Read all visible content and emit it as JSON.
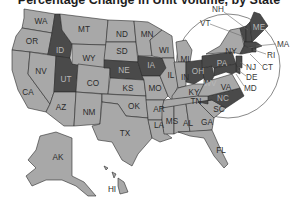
{
  "title": "Percentage Change in Unit Volume, by State",
  "colors": {
    "light": "#a8a8a8",
    "dark": "#4a4a4a",
    "border": "#2a2a2a",
    "background": "#ffffff"
  },
  "states": {
    "WA": {
      "label": "WA",
      "shade": "light"
    },
    "OR": {
      "label": "OR",
      "shade": "light"
    },
    "CA": {
      "label": "CA",
      "shade": "light"
    },
    "ID": {
      "label": "ID",
      "shade": "dark"
    },
    "NV": {
      "label": "NV",
      "shade": "light"
    },
    "UT": {
      "label": "UT",
      "shade": "dark"
    },
    "AZ": {
      "label": "AZ",
      "shade": "light"
    },
    "MT": {
      "label": "MT",
      "shade": "light"
    },
    "WY": {
      "label": "WY",
      "shade": "light"
    },
    "CO": {
      "label": "CO",
      "shade": "light"
    },
    "NM": {
      "label": "NM",
      "shade": "light"
    },
    "ND": {
      "label": "ND",
      "shade": "light"
    },
    "SD": {
      "label": "SD",
      "shade": "light"
    },
    "NE": {
      "label": "NE",
      "shade": "dark"
    },
    "KS": {
      "label": "KS",
      "shade": "light"
    },
    "OK": {
      "label": "OK",
      "shade": "light"
    },
    "TX": {
      "label": "TX",
      "shade": "light"
    },
    "MN": {
      "label": "MN",
      "shade": "light"
    },
    "IA": {
      "label": "IA",
      "shade": "dark"
    },
    "MO": {
      "label": "MO",
      "shade": "light"
    },
    "AR": {
      "label": "AR",
      "shade": "light"
    },
    "LA": {
      "label": "LA",
      "shade": "light"
    },
    "WI": {
      "label": "WI",
      "shade": "light"
    },
    "IL": {
      "label": "IL",
      "shade": "light"
    },
    "MI": {
      "label": "MI",
      "shade": "light"
    },
    "IN": {
      "label": "IN",
      "shade": "light"
    },
    "OH": {
      "label": "OH",
      "shade": "dark"
    },
    "KY": {
      "label": "KY",
      "shade": "light"
    },
    "TN": {
      "label": "TN",
      "shade": "light"
    },
    "MS": {
      "label": "MS",
      "shade": "light"
    },
    "AL": {
      "label": "AL",
      "shade": "light"
    },
    "GA": {
      "label": "GA",
      "shade": "light"
    },
    "FL": {
      "label": "FL",
      "shade": "light"
    },
    "SC": {
      "label": "SC",
      "shade": "light"
    },
    "NC": {
      "label": "NC",
      "shade": "dark"
    },
    "VA": {
      "label": "VA",
      "shade": "light"
    },
    "WV": {
      "label": "WV",
      "shade": "dark"
    },
    "PA": {
      "label": "PA",
      "shade": "dark"
    },
    "NY": {
      "label": "NY",
      "shade": "light"
    },
    "VT": {
      "label": "VT",
      "shade": "dark"
    },
    "NH": {
      "label": "NH",
      "shade": "dark"
    },
    "ME": {
      "label": "ME",
      "shade": "dark"
    },
    "MA": {
      "label": "MA",
      "shade": "dark"
    },
    "RI": {
      "label": "RI",
      "shade": "dark"
    },
    "CT": {
      "label": "CT",
      "shade": "dark"
    },
    "NJ": {
      "label": "NJ",
      "shade": "dark"
    },
    "DE": {
      "label": "DE",
      "shade": "dark"
    },
    "MD": {
      "label": "MD",
      "shade": "dark"
    },
    "AK": {
      "label": "AK",
      "shade": "light"
    },
    "HI": {
      "label": "HI",
      "shade": "light"
    }
  },
  "inset": {
    "label": "Northeast magnified inset"
  }
}
